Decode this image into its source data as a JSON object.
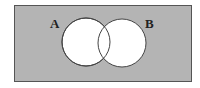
{
  "diagram": {
    "type": "venn",
    "universe": {
      "x": 14,
      "y": 5,
      "width": 177,
      "height": 76,
      "fill": "#b4b4b4",
      "stroke": "#555555"
    },
    "sets": [
      {
        "label": "A",
        "cx": 86,
        "cy": 42,
        "r": 24,
        "fill": "#ffffff",
        "label_x": 50,
        "label_y": 28
      },
      {
        "label": "B",
        "cx": 122,
        "cy": 43,
        "r": 24,
        "fill": "#ffffff",
        "label_x": 145,
        "label_y": 28
      }
    ],
    "shaded_region": "complement of A ∪ B"
  }
}
